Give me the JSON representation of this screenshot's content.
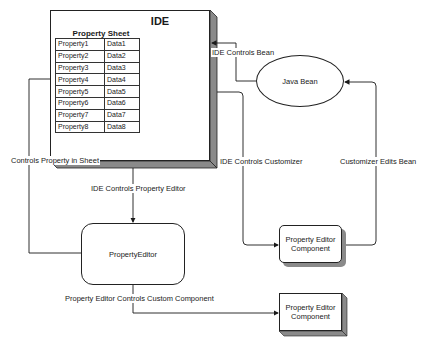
{
  "diagram": {
    "ide": {
      "title": "IDE",
      "property_sheet": {
        "title": "Property Sheet",
        "rows": [
          {
            "property": "Property1",
            "data": "Data1"
          },
          {
            "property": "Property2",
            "data": "Data2"
          },
          {
            "property": "Property3",
            "data": "Data3"
          },
          {
            "property": "Property4",
            "data": "Data4"
          },
          {
            "property": "Property5",
            "data": "Data5"
          },
          {
            "property": "Property6",
            "data": "Data6"
          },
          {
            "property": "Property7",
            "data": "Data7"
          },
          {
            "property": "Property8",
            "data": "Data8"
          }
        ]
      }
    },
    "java_bean": {
      "label": "Java Bean"
    },
    "property_editor": {
      "label": "PropertyEditor"
    },
    "customizer_component": {
      "line1": "Property Editor",
      "line2": "Component"
    },
    "custom_component": {
      "line1": "Property Editor",
      "line2": "Component"
    },
    "edges": {
      "ide_controls_bean": "IDE Controls Bean",
      "ide_controls_customizer": "IDE Controls Customizer",
      "customizer_edits_bean": "Customizer Edits Bean",
      "controls_property_in_sheet": "Controls Property in Sheet",
      "ide_controls_property_editor": "IDE Controls Property Editor",
      "property_editor_controls_custom_component": "Property Editor Controls Custom Component"
    },
    "colors": {
      "line": "#1a1a1a",
      "shadow": "#8a8a8a",
      "background": "#ffffff"
    }
  }
}
